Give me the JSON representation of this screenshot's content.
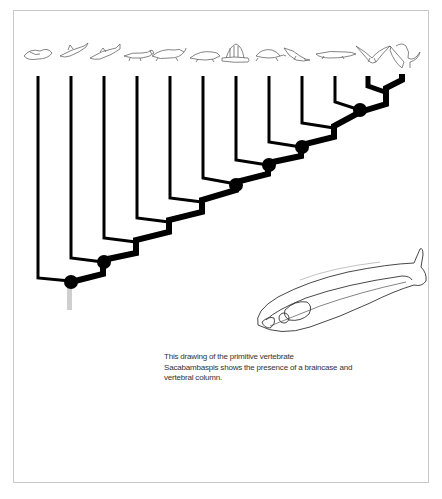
{
  "figure": {
    "type": "cladogram",
    "taxa_icons": [
      "jawless-fish-icon",
      "shark-icon",
      "bony-fish-icon",
      "lobe-finned-fish-icon",
      "amphibian-icon",
      "early-reptile-icon",
      "dimetrodon-icon",
      "turtle-icon",
      "plesiosaur-icon",
      "crocodile-icon",
      "pterosaur-icon",
      "dinosaur-icon"
    ],
    "tip_x": [
      38,
      71,
      104,
      137,
      170,
      203,
      236,
      269,
      302,
      335,
      368,
      402
    ],
    "node_count_marked": 6,
    "colors": {
      "branch": "#000000",
      "stem": "#c8c8c8",
      "sketch": "#555555",
      "border": "#c8c8c8"
    }
  },
  "illustration": {
    "subject": "Sacabambaspis"
  },
  "caption": {
    "line1": "This drawing of the primitive vertebrate",
    "line2": "Sacabambaspis shows the presence of a braincase and",
    "line3": "vertebral column."
  }
}
